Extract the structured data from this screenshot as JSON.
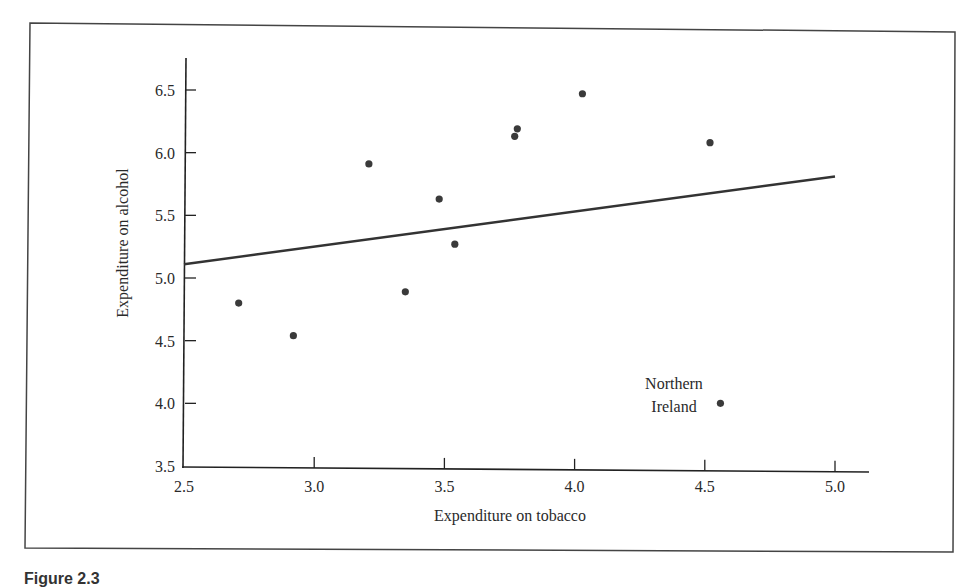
{
  "figure": {
    "caption": "Figure 2.3"
  },
  "chart_data": {
    "type": "scatter",
    "title": "",
    "xlabel": "Expenditure on tobacco",
    "ylabel": "Expenditure on alcohol",
    "xlim": [
      2.5,
      5.0
    ],
    "ylim": [
      3.5,
      6.75
    ],
    "xticks": [
      "2.5",
      "3.0",
      "3.5",
      "4.0",
      "4.5",
      "5.0"
    ],
    "yticks": [
      "3.5",
      "4.0",
      "4.5",
      "5.0",
      "5.5",
      "6.0",
      "6.5"
    ],
    "grid": false,
    "legend": null,
    "points": [
      {
        "x": 2.71,
        "y": 4.8
      },
      {
        "x": 2.92,
        "y": 4.54
      },
      {
        "x": 3.21,
        "y": 5.91
      },
      {
        "x": 3.35,
        "y": 4.89
      },
      {
        "x": 3.48,
        "y": 5.63
      },
      {
        "x": 3.54,
        "y": 5.27
      },
      {
        "x": 3.77,
        "y": 6.13
      },
      {
        "x": 3.78,
        "y": 6.19
      },
      {
        "x": 4.03,
        "y": 6.47
      },
      {
        "x": 4.52,
        "y": 6.08
      },
      {
        "x": 4.56,
        "y": 4.0,
        "label": "Northern Ireland"
      }
    ],
    "regression_line": {
      "x": [
        2.5,
        5.0
      ],
      "y": [
        5.11,
        5.81
      ]
    },
    "annotations": [
      {
        "text_lines": [
          "Northern",
          "Ireland"
        ],
        "x": 4.56,
        "y": 4.0
      }
    ],
    "colors": {
      "points": "#3a3a3a",
      "line": "#333333",
      "axes": "#222222",
      "frame": "#444444"
    }
  }
}
